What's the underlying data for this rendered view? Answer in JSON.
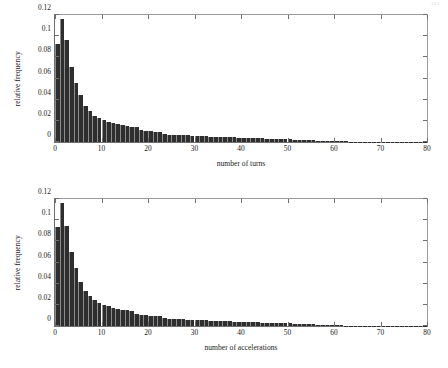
{
  "page": {
    "number": "165"
  },
  "chart_data": [
    {
      "type": "bar",
      "title": "",
      "xlabel": "number of turns",
      "ylabel": "relative frequency",
      "xlim": [
        0,
        80
      ],
      "ylim": [
        0,
        0.12
      ],
      "xticks": [
        0,
        10,
        20,
        30,
        40,
        50,
        60,
        70,
        80
      ],
      "xtick_labels": [
        "0",
        "10",
        "20",
        "30",
        "40",
        "50",
        "60",
        "70",
        "80"
      ],
      "yticks": [
        0,
        0.02,
        0.04,
        0.06,
        0.08,
        0.1,
        0.12
      ],
      "ytick_labels": [
        "0",
        "0.02",
        "0.04",
        "0.06",
        "0.08",
        "0.1",
        "0.12"
      ],
      "grid": false,
      "legend": "none",
      "bar_color": "#2e2e2e",
      "x": [
        0,
        1,
        2,
        3,
        4,
        5,
        6,
        7,
        8,
        9,
        10,
        11,
        12,
        13,
        14,
        15,
        16,
        17,
        18,
        19,
        20,
        21,
        22,
        23,
        24,
        25,
        26,
        27,
        28,
        29,
        30,
        31,
        32,
        33,
        34,
        35,
        36,
        37,
        38,
        39,
        40,
        41,
        42,
        43,
        44,
        45,
        46,
        47,
        48,
        49,
        50,
        51,
        52,
        53,
        54,
        55,
        56,
        57,
        58,
        59,
        60,
        61,
        62,
        63,
        64,
        65,
        66,
        67,
        68,
        69,
        70,
        71,
        72,
        73,
        74,
        75,
        76,
        77,
        78,
        79
      ],
      "values": [
        0.093,
        0.116,
        0.096,
        0.071,
        0.0555,
        0.044,
        0.0345,
        0.029,
        0.025,
        0.0225,
        0.0205,
        0.0192,
        0.018,
        0.017,
        0.016,
        0.0152,
        0.0145,
        0.0138,
        0.011,
        0.0105,
        0.01,
        0.0096,
        0.0092,
        0.0074,
        0.0071,
        0.0068,
        0.0066,
        0.0064,
        0.0062,
        0.006,
        0.0058,
        0.0056,
        0.0054,
        0.0052,
        0.005,
        0.0048,
        0.0046,
        0.0045,
        0.0043,
        0.0042,
        0.004,
        0.0038,
        0.0037,
        0.0035,
        0.0034,
        0.0032,
        0.0031,
        0.0029,
        0.0028,
        0.0026,
        0.0025,
        0.0023,
        0.0021,
        0.002,
        0.0018,
        0.0016,
        0.0014,
        0.0012,
        0.001,
        0.0009,
        0.0007,
        0.0006,
        0.0005,
        0.0004,
        0.0003,
        0.00025,
        0.0002,
        0.00015,
        0.0001,
        8e-05,
        6e-05,
        5e-05,
        4e-05,
        3e-05,
        2e-05,
        2e-05,
        1e-05,
        1e-05,
        1e-05,
        1e-05
      ]
    },
    {
      "type": "bar",
      "title": "",
      "xlabel": "number of accelerations",
      "ylabel": "relative frequency",
      "xlim": [
        0,
        80
      ],
      "ylim": [
        0,
        0.12
      ],
      "xticks": [
        0,
        10,
        20,
        30,
        40,
        50,
        60,
        70,
        80
      ],
      "xtick_labels": [
        "0",
        "10",
        "20",
        "30",
        "40",
        "50",
        "60",
        "70",
        "80"
      ],
      "yticks": [
        0,
        0.02,
        0.04,
        0.06,
        0.08,
        0.1,
        0.12
      ],
      "ytick_labels": [
        "0",
        "0.02",
        "0.04",
        "0.06",
        "0.08",
        "0.1",
        "0.12"
      ],
      "grid": false,
      "legend": "none",
      "bar_color": "#2e2e2e",
      "x": [
        0,
        1,
        2,
        3,
        4,
        5,
        6,
        7,
        8,
        9,
        10,
        11,
        12,
        13,
        14,
        15,
        16,
        17,
        18,
        19,
        20,
        21,
        22,
        23,
        24,
        25,
        26,
        27,
        28,
        29,
        30,
        31,
        32,
        33,
        34,
        35,
        36,
        37,
        38,
        39,
        40,
        41,
        42,
        43,
        44,
        45,
        46,
        47,
        48,
        49,
        50,
        51,
        52,
        53,
        54,
        55,
        56,
        57,
        58,
        59,
        60,
        61,
        62,
        63,
        64,
        65,
        66,
        67,
        68,
        69,
        70,
        71,
        72,
        73,
        74,
        75,
        76,
        77,
        78,
        79
      ],
      "values": [
        0.0935,
        0.1158,
        0.0945,
        0.07,
        0.0545,
        0.042,
        0.033,
        0.028,
        0.0245,
        0.022,
        0.02,
        0.0186,
        0.0174,
        0.0164,
        0.0155,
        0.0147,
        0.014,
        0.0112,
        0.0107,
        0.0103,
        0.0099,
        0.0095,
        0.0091,
        0.0072,
        0.007,
        0.0068,
        0.0066,
        0.0063,
        0.0061,
        0.0059,
        0.0057,
        0.0055,
        0.0053,
        0.0051,
        0.0049,
        0.0047,
        0.0046,
        0.0044,
        0.0042,
        0.0041,
        0.0039,
        0.0038,
        0.0036,
        0.0034,
        0.0033,
        0.0031,
        0.003,
        0.0028,
        0.0027,
        0.0025,
        0.0024,
        0.0022,
        0.002,
        0.0019,
        0.0017,
        0.0015,
        0.0013,
        0.0011,
        0.001,
        0.0008,
        0.0006,
        0.0005,
        0.0004,
        0.0003,
        0.00025,
        0.0002,
        0.00015,
        0.0001,
        8e-05,
        6e-05,
        5e-05,
        4e-05,
        3e-05,
        2e-05,
        2e-05,
        1e-05,
        1e-05,
        1e-05,
        1e-05,
        1e-05
      ]
    }
  ]
}
